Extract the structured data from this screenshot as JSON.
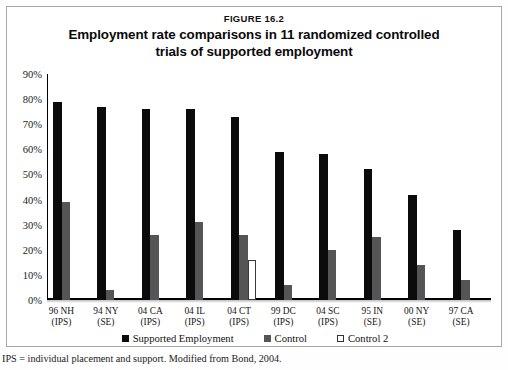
{
  "figure": {
    "number": "FIGURE 16.2",
    "title_line1": "Employment rate comparisons in 11 randomized controlled",
    "title_line2": "trials of supported employment",
    "footnote": "IPS = individual placement and support. Modified from Bond, 2004."
  },
  "colors": {
    "supported_employment": "#0b0b0b",
    "control": "#555557",
    "control2": "#ffffff",
    "frame": "#a8a8a8"
  },
  "chart_data": {
    "type": "bar",
    "title": "Employment rate comparisons in 11 randomized controlled trials of supported employment",
    "xlabel": "",
    "ylabel": "",
    "ylim": [
      0,
      90
    ],
    "grid": false,
    "legend_position": "bottom",
    "ytick_labels": [
      "90%",
      "80%",
      "70%",
      "60%",
      "50%",
      "40%",
      "30%",
      "20%",
      "10%",
      "0%"
    ],
    "ytick_values": [
      90,
      80,
      70,
      60,
      50,
      40,
      30,
      20,
      10,
      0
    ],
    "categories": [
      "96 NH (IPS)",
      "94 NY (SE)",
      "04 CA (IPS)",
      "04 IL (IPS)",
      "04 CT (IPS)",
      "99 DC (IPS)",
      "04 SC (IPS)",
      "95 IN (SE)",
      "00 NY (SE)",
      "97 CA (SE)"
    ],
    "category_lines": [
      {
        "l1": "96 NH",
        "l2": "(IPS)"
      },
      {
        "l1": "94 NY",
        "l2": "(SE)"
      },
      {
        "l1": "04 CA",
        "l2": "(IPS)"
      },
      {
        "l1": "04 IL",
        "l2": "(IPS)"
      },
      {
        "l1": "04 CT",
        "l2": "(IPS)"
      },
      {
        "l1": "99 DC",
        "l2": "(IPS)"
      },
      {
        "l1": "04 SC",
        "l2": "(IPS)"
      },
      {
        "l1": "95 IN",
        "l2": "(SE)"
      },
      {
        "l1": "00 NY",
        "l2": "(SE)"
      },
      {
        "l1": "97 CA",
        "l2": "(SE)"
      }
    ],
    "series": [
      {
        "name": "Supported Employment",
        "color": "#0b0b0b",
        "values": [
          79,
          77,
          76,
          76,
          73,
          59,
          58,
          52,
          42,
          28
        ]
      },
      {
        "name": "Control",
        "color": "#555557",
        "values": [
          39,
          4,
          26,
          31,
          26,
          6,
          20,
          25,
          14,
          8
        ]
      },
      {
        "name": "Control 2",
        "color": "#ffffff",
        "values": [
          null,
          null,
          null,
          null,
          16,
          null,
          null,
          null,
          null,
          null
        ]
      }
    ]
  },
  "legend": {
    "items": [
      {
        "label": "Supported Employment",
        "swatch": "se"
      },
      {
        "label": "Control",
        "swatch": "ctrl"
      },
      {
        "label": "Control 2",
        "swatch": "ctrl2"
      }
    ]
  }
}
